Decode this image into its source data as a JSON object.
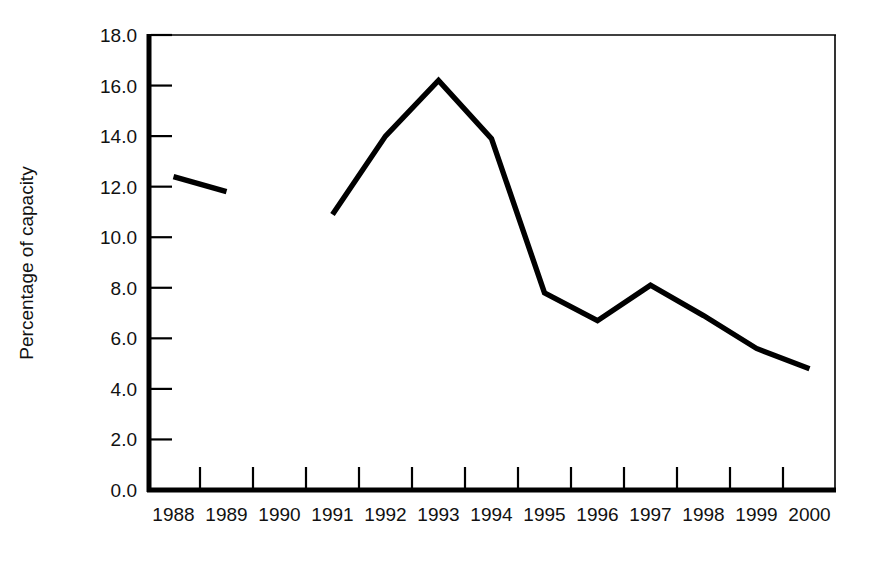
{
  "chart_data": {
    "type": "line",
    "title": "",
    "subtitle": "",
    "xlabel": "",
    "ylabel": "Percentage of capacity",
    "categories": [
      "1988",
      "1989",
      "1990",
      "1991",
      "1992",
      "1993",
      "1994",
      "1995",
      "1996",
      "1997",
      "1998",
      "1999",
      "2000"
    ],
    "x_tick_labels": [
      "1988",
      "1989",
      "1990",
      "1991",
      "1992",
      "1993",
      "1994",
      "1995",
      "1996",
      "1997",
      "1998",
      "1999",
      "2000"
    ],
    "y_tick_labels": [
      "0.0",
      "2.0",
      "4.0",
      "6.0",
      "8.0",
      "10.0",
      "12.0",
      "14.0",
      "16.0",
      "18.0"
    ],
    "y_tick_values": [
      0.0,
      2.0,
      4.0,
      6.0,
      8.0,
      10.0,
      12.0,
      14.0,
      16.0,
      18.0
    ],
    "ylim": [
      0.0,
      18.0
    ],
    "ytick_step": 2.0,
    "grid": false,
    "legend": null,
    "legend_position": "none",
    "series": [
      {
        "name": "Percentage of capacity",
        "color": "#000000",
        "points": [
          {
            "x": "1988",
            "y": 12.4
          },
          {
            "x": "1989",
            "y": 11.8
          }
        ]
      },
      {
        "name": "Percentage of capacity",
        "color": "#000000",
        "points": [
          {
            "x": "1991",
            "y": 10.9
          },
          {
            "x": "1992",
            "y": 14.0
          },
          {
            "x": "1993",
            "y": 16.2
          },
          {
            "x": "1994",
            "y": 13.9
          },
          {
            "x": "1995",
            "y": 7.8
          },
          {
            "x": "1996",
            "y": 6.7
          },
          {
            "x": "1997",
            "y": 8.1
          },
          {
            "x": "1998",
            "y": 6.9
          },
          {
            "x": "1999",
            "y": 5.6
          },
          {
            "x": "2000",
            "y": 4.8
          }
        ]
      }
    ]
  },
  "axis": {
    "y_label": "Percentage of capacity",
    "y_labels": [
      "18.0",
      "16.0",
      "14.0",
      "12.0",
      "10.0",
      "8.0",
      "6.0",
      "4.0",
      "2.0",
      "0.0"
    ],
    "x_labels": [
      "1988",
      "1989",
      "1990",
      "1991",
      "1992",
      "1993",
      "1994",
      "1995",
      "1996",
      "1997",
      "1998",
      "1999",
      "2000"
    ]
  },
  "colors": {
    "line": "#000000",
    "axis": "#000000",
    "text": "#111111",
    "background": "#ffffff"
  }
}
